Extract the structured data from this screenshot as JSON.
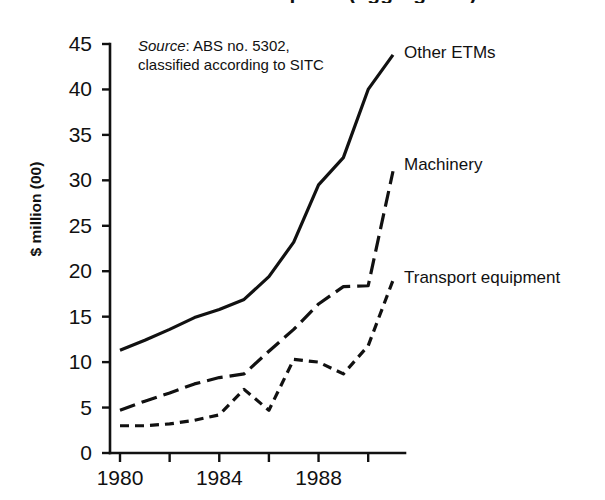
{
  "figure": {
    "title_partial": "merchandise imports (aggregated)",
    "source_note": {
      "label": "Source",
      "text": ": ABS no. 5302,",
      "line2": "classified according to SITC"
    }
  },
  "chart_data": {
    "type": "line",
    "title": "",
    "xlabel": "",
    "ylabel": "$ million (00)",
    "xlim": [
      1980,
      1991
    ],
    "ylim": [
      0,
      45
    ],
    "grid": false,
    "legend_position": "right-inline",
    "x": [
      1980,
      1981,
      1982,
      1983,
      1984,
      1985,
      1986,
      1987,
      1988,
      1989,
      1990,
      1991
    ],
    "xtick_values": [
      1980,
      1982,
      1984,
      1986,
      1988,
      1990
    ],
    "xtick_labels": [
      "1980",
      "",
      "1984",
      "",
      "1988",
      ""
    ],
    "xtick_labels_shown": [
      "1980",
      "1984",
      "1988"
    ],
    "ytick_values": [
      0,
      5,
      10,
      15,
      20,
      25,
      30,
      35,
      40,
      45
    ],
    "ytick_labels": [
      "0",
      "5",
      "10",
      "15",
      "20",
      "25",
      "30",
      "35",
      "40",
      "45"
    ],
    "series": [
      {
        "name": "Other ETMs",
        "style": "solid",
        "color": "#111111",
        "values": [
          11.3,
          12.4,
          13.6,
          14.9,
          15.8,
          16.9,
          19.4,
          23.2,
          29.5,
          32.5,
          40.0,
          43.8
        ]
      },
      {
        "name": "Machinery",
        "style": "long-dash",
        "color": "#111111",
        "values": [
          4.7,
          5.7,
          6.6,
          7.6,
          8.3,
          8.7,
          11.2,
          13.6,
          16.4,
          18.3,
          18.4,
          31.0
        ]
      },
      {
        "name": "Transport equipment",
        "style": "short-dash",
        "color": "#111111",
        "values": [
          3.0,
          3.0,
          3.2,
          3.6,
          4.2,
          7.0,
          4.7,
          10.3,
          10.0,
          8.7,
          11.8,
          19.0
        ]
      }
    ]
  },
  "series_labels": [
    {
      "text": "Other ETMs"
    },
    {
      "text": "Machinery"
    },
    {
      "text": "Transport equipment"
    }
  ]
}
